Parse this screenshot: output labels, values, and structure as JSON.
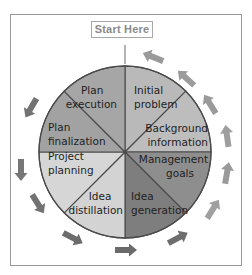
{
  "diagram": {
    "start_label": "Start Here",
    "center": [
      125,
      152
    ],
    "radius": 86,
    "sectors": [
      {
        "name": "initial-problem",
        "lines": [
          "Initial",
          "problem"
        ],
        "color": "#b9b9b9",
        "start_deg": 0,
        "end_deg": 45
      },
      {
        "name": "background-information",
        "lines": [
          "Background",
          "information"
        ],
        "color": "#bdbdbd",
        "start_deg": 45,
        "end_deg": 90
      },
      {
        "name": "management-goals",
        "lines": [
          "Management",
          "goals"
        ],
        "color": "#8e8e8e",
        "start_deg": 90,
        "end_deg": 135
      },
      {
        "name": "idea-generation",
        "lines": [
          "Idea",
          "generation"
        ],
        "color": "#7e7e7e",
        "start_deg": 135,
        "end_deg": 180
      },
      {
        "name": "idea-distillation",
        "lines": [
          "Idea",
          "distillation"
        ],
        "color": "#d3d3d3",
        "start_deg": 180,
        "end_deg": 225
      },
      {
        "name": "project-planning",
        "lines": [
          "Project",
          "planning"
        ],
        "color": "#d6d6d6",
        "start_deg": 225,
        "end_deg": 270
      },
      {
        "name": "plan-finalization",
        "lines": [
          "Plan",
          "finalization"
        ],
        "color": "#a2a2a2",
        "start_deg": 270,
        "end_deg": 315
      },
      {
        "name": "plan-execution",
        "lines": [
          "Plan",
          "execution"
        ],
        "color": "#a6a6a6",
        "start_deg": 315,
        "end_deg": 360
      }
    ],
    "arrows": [
      {
        "x": 153,
        "y": 57,
        "rot": 22,
        "color": "#9a9a9a"
      },
      {
        "x": 186,
        "y": 78,
        "rot": 42,
        "color": "#9c9c9c"
      },
      {
        "x": 210,
        "y": 104,
        "rot": 58,
        "color": "#9a9a9a"
      },
      {
        "x": 227,
        "y": 136,
        "rot": 82,
        "color": "#9e9e9e"
      },
      {
        "x": 227,
        "y": 173,
        "rot": 100,
        "color": "#9a9a9a"
      },
      {
        "x": 213,
        "y": 209,
        "rot": 122,
        "color": "#a0a0a0"
      },
      {
        "x": 178,
        "y": 238,
        "rot": 152,
        "color": "#6e6e6e"
      },
      {
        "x": 126,
        "y": 250,
        "rot": 180,
        "color": "#6a6a6a"
      },
      {
        "x": 73,
        "y": 238,
        "rot": 208,
        "color": "#6c6c6c"
      },
      {
        "x": 38,
        "y": 204,
        "rot": 238,
        "color": "#727272"
      },
      {
        "x": 21,
        "y": 170,
        "rot": 270,
        "color": "#767676"
      },
      {
        "x": 31,
        "y": 108,
        "rot": 300,
        "color": "#737373"
      }
    ]
  }
}
